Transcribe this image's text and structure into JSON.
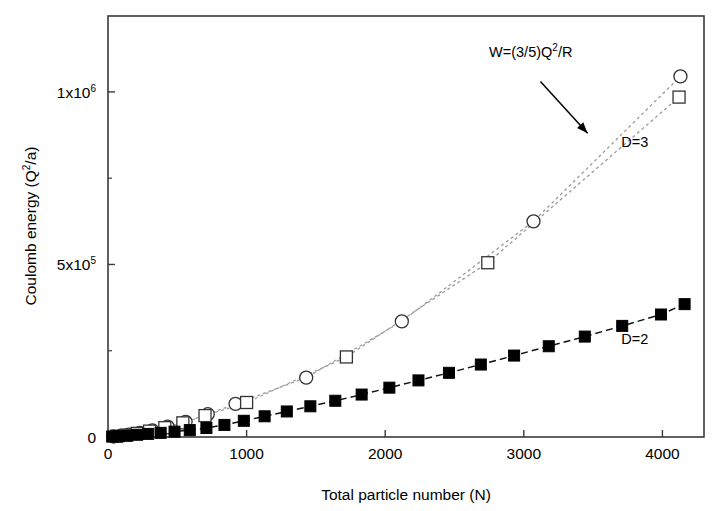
{
  "chart_data": {
    "type": "scatter",
    "title": "",
    "xlabel": "Total particle number (N)",
    "ylabel": "Coulomb energy (Q²/a)",
    "xlim": [
      0,
      4300
    ],
    "ylim": [
      0,
      1220000
    ],
    "grid": false,
    "legend_position": "inline-annotations",
    "xticks": [
      0,
      1000,
      2000,
      3000,
      4000
    ],
    "xtick_labels": [
      "0",
      "1000",
      "2000",
      "3000",
      "4000"
    ],
    "yticks": [
      0,
      500000,
      1000000
    ],
    "ytick_labels": [
      "0",
      "5x10^5",
      "1x10^6"
    ],
    "ytick_label_parts": [
      {
        "mantissa": "0",
        "base": "",
        "exponent": ""
      },
      {
        "mantissa": "5x10",
        "base": "10",
        "exponent": "5"
      },
      {
        "mantissa": "1x10",
        "base": "10",
        "exponent": "6"
      }
    ],
    "minor_yticks": [
      250000,
      750000
    ],
    "series": [
      {
        "name": "D=3 (circles)",
        "label": "D=3",
        "marker": "open-circle",
        "line": "dashed",
        "color": "#000000",
        "points": [
          {
            "x": 40,
            "y": 1500
          },
          {
            "x": 90,
            "y": 3500
          },
          {
            "x": 150,
            "y": 7000
          },
          {
            "x": 230,
            "y": 12000
          },
          {
            "x": 320,
            "y": 19000
          },
          {
            "x": 430,
            "y": 30000
          },
          {
            "x": 560,
            "y": 44000
          },
          {
            "x": 720,
            "y": 66000
          },
          {
            "x": 920,
            "y": 96000
          },
          {
            "x": 1430,
            "y": 172000
          },
          {
            "x": 2120,
            "y": 335000
          },
          {
            "x": 3070,
            "y": 625000
          },
          {
            "x": 4130,
            "y": 1045000
          }
        ]
      },
      {
        "name": "D=3 (squares)",
        "label": "D=3",
        "marker": "open-square",
        "line": "dashed",
        "color": "#000000",
        "points": [
          {
            "x": 60,
            "y": 2000
          },
          {
            "x": 130,
            "y": 5500
          },
          {
            "x": 210,
            "y": 10500
          },
          {
            "x": 300,
            "y": 17000
          },
          {
            "x": 410,
            "y": 27000
          },
          {
            "x": 540,
            "y": 41000
          },
          {
            "x": 700,
            "y": 62000
          },
          {
            "x": 1000,
            "y": 100000
          },
          {
            "x": 1720,
            "y": 232000
          },
          {
            "x": 2740,
            "y": 505000
          },
          {
            "x": 4120,
            "y": 985000
          }
        ]
      },
      {
        "name": "D=2",
        "label": "D=2",
        "marker": "filled-square",
        "line": "dashed",
        "color": "#000000",
        "points": [
          {
            "x": 30,
            "y": 1200
          },
          {
            "x": 80,
            "y": 2500
          },
          {
            "x": 140,
            "y": 4200
          },
          {
            "x": 210,
            "y": 6500
          },
          {
            "x": 290,
            "y": 9000
          },
          {
            "x": 380,
            "y": 12000
          },
          {
            "x": 480,
            "y": 15500
          },
          {
            "x": 590,
            "y": 20000
          },
          {
            "x": 710,
            "y": 26000
          },
          {
            "x": 840,
            "y": 35000
          },
          {
            "x": 980,
            "y": 47000
          },
          {
            "x": 1130,
            "y": 60000
          },
          {
            "x": 1290,
            "y": 74000
          },
          {
            "x": 1460,
            "y": 89000
          },
          {
            "x": 1640,
            "y": 105000
          },
          {
            "x": 1830,
            "y": 123000
          },
          {
            "x": 2030,
            "y": 143000
          },
          {
            "x": 2240,
            "y": 164000
          },
          {
            "x": 2460,
            "y": 186000
          },
          {
            "x": 2690,
            "y": 210000
          },
          {
            "x": 2930,
            "y": 236000
          },
          {
            "x": 3180,
            "y": 263000
          },
          {
            "x": 3440,
            "y": 291000
          },
          {
            "x": 3710,
            "y": 322000
          },
          {
            "x": 3990,
            "y": 355000
          },
          {
            "x": 4160,
            "y": 385000
          }
        ]
      }
    ],
    "annotations": [
      {
        "name": "formula",
        "text": "W=(3/5)Q2/R",
        "text_parts": {
          "pre": "W=(3/5)Q",
          "sup": "2",
          "post": "/R"
        },
        "x": 3050,
        "y": 1100000
      },
      {
        "name": "series-label-d3",
        "text": "D=3",
        "x": 3800,
        "y": 840000
      },
      {
        "name": "series-label-d2",
        "text": "D=2",
        "x": 3800,
        "y": 270000
      }
    ],
    "arrow": {
      "x1": 3120,
      "y1": 1030000,
      "x2": 3460,
      "y2": 880000
    }
  }
}
